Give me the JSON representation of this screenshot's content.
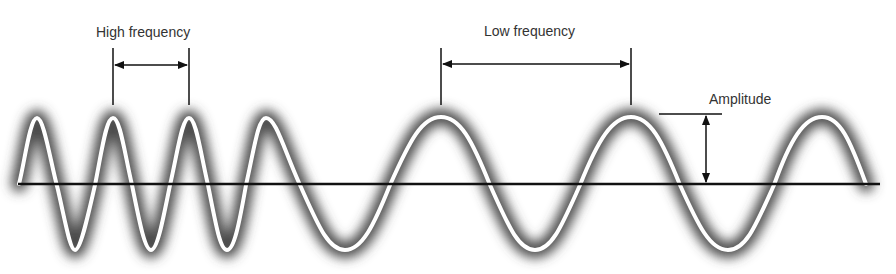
{
  "diagram": {
    "labels": {
      "high_frequency": "High frequency",
      "low_frequency": "Low frequency",
      "amplitude": "Amplitude"
    },
    "colors": {
      "wave_line": "#ffffff",
      "wave_glow": "#555555",
      "axis": "#111111",
      "annotation": "#111111",
      "background": "#ffffff"
    },
    "baseline_y": 184,
    "peak_y": 117,
    "trough_y": 250
  }
}
